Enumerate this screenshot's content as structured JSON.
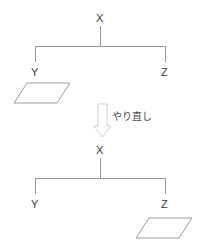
{
  "figure": {
    "type": "before-after-tree-transformation",
    "stroke_color": "#9a9a9a",
    "text_color": "#3b3b3b",
    "background_color": "#ffffff",
    "arrow_color": "#c6c6c6"
  },
  "top_diagram": {
    "name": "before-tree",
    "root": {
      "label": "X"
    },
    "children": [
      {
        "label": "Y",
        "has_shape": true,
        "shape": "parallelogram"
      },
      {
        "label": "Z",
        "has_shape": false
      }
    ]
  },
  "transition": {
    "arrow_icon": "down-arrow-icon",
    "caption": "やり直し"
  },
  "bottom_diagram": {
    "name": "after-tree",
    "root": {
      "label": "X"
    },
    "children": [
      {
        "label": "Y",
        "has_shape": false
      },
      {
        "label": "Z",
        "has_shape": true,
        "shape": "parallelogram"
      }
    ]
  }
}
